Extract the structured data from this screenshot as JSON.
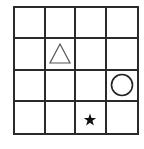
{
  "grid": {
    "rows": 4,
    "cols": 4,
    "line_color": "#2a2a2a",
    "background": "#ffffff"
  },
  "shapes": [
    {
      "type": "triangle",
      "style": "outline",
      "row": 1,
      "col": 1,
      "color": "#555555"
    },
    {
      "type": "circle",
      "style": "outline",
      "row": 2,
      "col": 3,
      "color": "#222222"
    },
    {
      "type": "star",
      "style": "filled",
      "row": 3,
      "col": 2,
      "color": "#111111"
    }
  ]
}
